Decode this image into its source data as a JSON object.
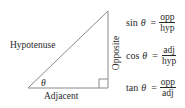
{
  "diagram": {
    "labels": {
      "hypotenuse": "Hypotenuse",
      "adjacent": "Adjacent",
      "opposite": "Opposite",
      "angle": "θ"
    },
    "formulas": [
      {
        "fn": "sin",
        "var": "θ",
        "eq": "=",
        "num": "opp",
        "den": "hyp"
      },
      {
        "fn": "cos",
        "var": "θ",
        "eq": "=",
        "num": "adj",
        "den": "hyp"
      },
      {
        "fn": "tan",
        "var": "θ",
        "eq": "=",
        "num": "opp",
        "den": "adj"
      }
    ],
    "colors": {
      "line": "#8a8a8a",
      "text": "#2a2a2a"
    }
  }
}
